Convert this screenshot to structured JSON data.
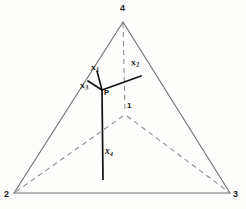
{
  "figure": {
    "background_color": "#fdfdfc",
    "solid_edge_color": "#6e6e6e",
    "hidden_edge_color": "#8a8a8a",
    "vector_color": "#111111"
  },
  "vertices": [
    {
      "id": "v4",
      "label": "4",
      "x": 123,
      "y": 8,
      "desc": "apex-top"
    },
    {
      "id": "v2",
      "label": "2",
      "x": 6,
      "y": 195,
      "desc": "bottom-left"
    },
    {
      "id": "v3",
      "label": "3",
      "x": 233,
      "y": 195,
      "desc": "bottom-right"
    },
    {
      "id": "v1",
      "label": "1",
      "x": 127,
      "y": 103,
      "desc": "hidden-back"
    }
  ],
  "points": [
    {
      "id": "P",
      "label": "P",
      "x": 104,
      "y": 89,
      "desc": "interior-point"
    }
  ],
  "vectors": [
    {
      "id": "x1",
      "label": "x",
      "sub": "1",
      "label_x": 91,
      "label_y": 65,
      "desc": "short vector up from P"
    },
    {
      "id": "x2",
      "label": "x",
      "sub": "2",
      "label_x": 131,
      "label_y": 60,
      "desc": "vector up-right from P"
    },
    {
      "id": "x3",
      "label": "x",
      "sub": "3",
      "label_x": 81,
      "label_y": 83,
      "desc": "vector up-left from P"
    },
    {
      "id": "x4",
      "label": "x",
      "sub": "4",
      "label_x": 104,
      "label_y": 148,
      "desc": "vector straight down from P"
    }
  ],
  "geometry": {
    "apex": {
      "x": 123,
      "y": 22
    },
    "bottom_left": {
      "x": 14,
      "y": 193
    },
    "bottom_right": {
      "x": 230,
      "y": 193
    },
    "back_vertex": {
      "x": 125,
      "y": 115
    },
    "interior_point": {
      "x": 102,
      "y": 90
    },
    "x1_tip": {
      "x": 96,
      "y": 70
    },
    "x2_tip": {
      "x": 141,
      "y": 76
    },
    "x3_tip": {
      "x": 88,
      "y": 81
    },
    "x4_tip": {
      "x": 103,
      "y": 180
    }
  }
}
